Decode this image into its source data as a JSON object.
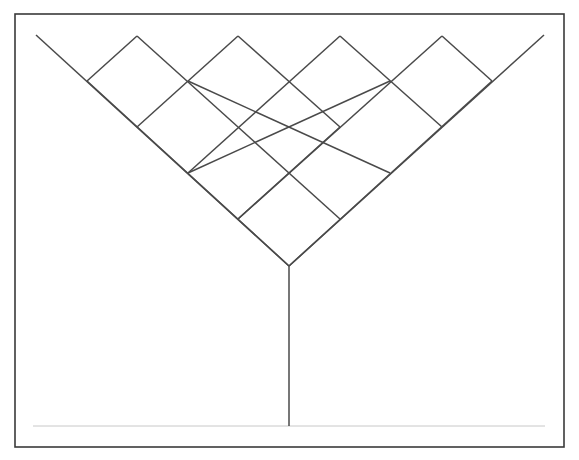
{
  "diagram": {
    "type": "lattice-v-tree",
    "colors": {
      "background": "#ffffff",
      "line": "#4a4a4a",
      "frame": "#3a3a3a",
      "baseline": "#c8c8c8"
    },
    "frame": {
      "x": 15,
      "y": 14,
      "width": 549,
      "height": 433
    },
    "apex": {
      "x": 289,
      "y": 266
    },
    "left_arm_start": {
      "x": 36,
      "y": 35
    },
    "right_arm_end": {
      "x": 544,
      "y": 35
    },
    "stem_bottom": {
      "x": 289,
      "y": 426
    },
    "baseline": {
      "x1": 33,
      "x2": 545,
      "y": 426
    },
    "peaks": [
      {
        "x": 137,
        "y": 36
      },
      {
        "x": 238,
        "y": 36
      },
      {
        "x": 340,
        "y": 36
      },
      {
        "x": 442,
        "y": 36
      }
    ],
    "segments": [
      [
        137,
        36,
        87,
        81
      ],
      [
        238,
        36,
        137,
        127
      ],
      [
        340,
        36,
        188,
        173
      ],
      [
        442,
        36,
        238,
        219
      ],
      [
        137,
        36,
        238,
        127
      ],
      [
        238,
        36,
        340,
        127
      ],
      [
        340,
        36,
        442,
        127
      ],
      [
        442,
        36,
        492,
        81
      ],
      [
        87,
        81,
        289,
        266
      ],
      [
        188,
        81,
        390,
        173
      ],
      [
        238,
        127,
        340,
        219
      ],
      [
        492,
        81,
        289,
        266
      ],
      [
        390,
        81,
        188,
        173
      ],
      [
        340,
        127,
        238,
        219
      ]
    ]
  }
}
